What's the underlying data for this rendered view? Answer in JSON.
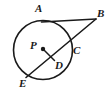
{
  "figure": {
    "width": 111,
    "height": 91,
    "background_color": "#ffffff",
    "stroke_color": "#1a1a1a"
  },
  "labels": {
    "a": "A",
    "b": "B",
    "c": "C",
    "d": "D",
    "e": "E",
    "p": "P"
  },
  "geometry": {
    "circle": {
      "cx": 43,
      "cy": 50,
      "r": 29.5
    },
    "center_dot": {
      "cx": 43,
      "cy": 49,
      "r": 2.2
    },
    "points": {
      "A": {
        "x": 41.5,
        "y": 22.0
      },
      "B": {
        "x": 96.0,
        "y": 19.0
      },
      "C": {
        "x": 69.5,
        "y": 51.5
      },
      "D": {
        "x": 54.5,
        "y": 60.5
      },
      "E": {
        "x": 26.0,
        "y": 77.5
      },
      "P": {
        "x": 43.0,
        "y": 49.0
      }
    },
    "segments": [
      {
        "name": "tangent-AB",
        "from": "A",
        "to": "B"
      },
      {
        "name": "secant-EB",
        "from": "E",
        "to": "B"
      },
      {
        "name": "radius-PD",
        "from": "P",
        "to": "D"
      }
    ]
  },
  "label_positions": {
    "a": {
      "x": 35,
      "y": 3
    },
    "b": {
      "x": 97,
      "y": 8
    },
    "c": {
      "x": 73,
      "y": 45
    },
    "d": {
      "x": 55,
      "y": 60
    },
    "e": {
      "x": 19,
      "y": 78
    },
    "p": {
      "x": 30,
      "y": 40
    }
  }
}
